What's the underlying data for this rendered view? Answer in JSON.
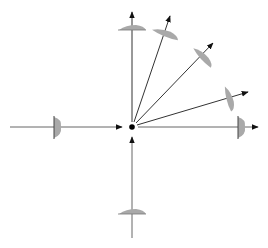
{
  "diagram": {
    "title": "",
    "colors": {
      "background": "#ffffff",
      "ray": "#222222",
      "ray_light": "#666666",
      "lens_fill": "#a9a9a9",
      "lens_edge": "#555555",
      "focus_dot": "#000000"
    },
    "focus_point": {
      "label": ""
    },
    "rays": [
      {
        "id": "left",
        "direction": "incoming",
        "angle_deg": 180
      },
      {
        "id": "bottom",
        "direction": "incoming",
        "angle_deg": 270
      },
      {
        "id": "up",
        "direction": "outgoing",
        "angle_deg": 90
      },
      {
        "id": "up-right-steep",
        "direction": "outgoing",
        "angle_deg": 68
      },
      {
        "id": "up-right-diagonal",
        "direction": "outgoing",
        "angle_deg": 42
      },
      {
        "id": "up-right-shallow",
        "direction": "outgoing",
        "angle_deg": 16
      },
      {
        "id": "right",
        "direction": "outgoing",
        "angle_deg": 0
      }
    ],
    "lenses": [
      {
        "id": "lens-left",
        "on_ray": "left",
        "type": "plano-convex"
      },
      {
        "id": "lens-bottom",
        "on_ray": "bottom",
        "type": "plano-convex"
      },
      {
        "id": "lens-up",
        "on_ray": "up",
        "type": "plano-convex"
      },
      {
        "id": "lens-up-right-steep",
        "on_ray": "up-right-steep",
        "type": "plano-convex"
      },
      {
        "id": "lens-up-right-diagonal",
        "on_ray": "up-right-diagonal",
        "type": "plano-convex"
      },
      {
        "id": "lens-up-right-shallow",
        "on_ray": "up-right-shallow",
        "type": "plano-convex"
      },
      {
        "id": "lens-right",
        "on_ray": "right",
        "type": "plano-convex"
      }
    ]
  }
}
